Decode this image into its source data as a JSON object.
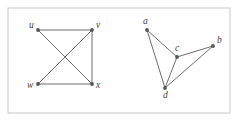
{
  "figure": {
    "width": 239,
    "height": 122,
    "background_color": "#ffffff",
    "border": {
      "color": "#c8c8c8",
      "width": 1,
      "x": 8,
      "y": 8,
      "w": 222,
      "h": 105
    },
    "style": {
      "edge_color": "#6e6e6e",
      "edge_width": 1,
      "vertex_color": "#555555",
      "vertex_radius": 1.9,
      "label_color": "#3c3c3c"
    }
  },
  "graphs": [
    {
      "name": "left-graph",
      "vertices": [
        {
          "id": "u",
          "label": "u",
          "x": 38,
          "y": 30,
          "label_x": 29,
          "label_y": 28
        },
        {
          "id": "v",
          "label": "v",
          "x": 92,
          "y": 30,
          "label_x": 96,
          "label_y": 28
        },
        {
          "id": "w",
          "label": "w",
          "x": 38,
          "y": 84,
          "label_x": 27,
          "label_y": 88
        },
        {
          "id": "x",
          "label": "x",
          "x": 92,
          "y": 84,
          "label_x": 96,
          "label_y": 88
        }
      ],
      "edges": [
        {
          "from": "u",
          "to": "v"
        },
        {
          "from": "u",
          "to": "x"
        },
        {
          "from": "v",
          "to": "w"
        },
        {
          "from": "v",
          "to": "x"
        },
        {
          "from": "w",
          "to": "x"
        }
      ]
    },
    {
      "name": "right-graph",
      "vertices": [
        {
          "id": "a",
          "label": "a",
          "x": 147,
          "y": 30,
          "label_x": 143,
          "label_y": 24
        },
        {
          "id": "b",
          "label": "b",
          "x": 213,
          "y": 46,
          "label_x": 217,
          "label_y": 43
        },
        {
          "id": "c",
          "label": "c",
          "x": 177,
          "y": 57,
          "label_x": 175,
          "label_y": 51
        },
        {
          "id": "d",
          "label": "d",
          "x": 165,
          "y": 88,
          "label_x": 163,
          "label_y": 98
        }
      ],
      "edges": [
        {
          "from": "a",
          "to": "c"
        },
        {
          "from": "a",
          "to": "d"
        },
        {
          "from": "c",
          "to": "b"
        },
        {
          "from": "c",
          "to": "d"
        },
        {
          "from": "b",
          "to": "d"
        }
      ]
    }
  ]
}
